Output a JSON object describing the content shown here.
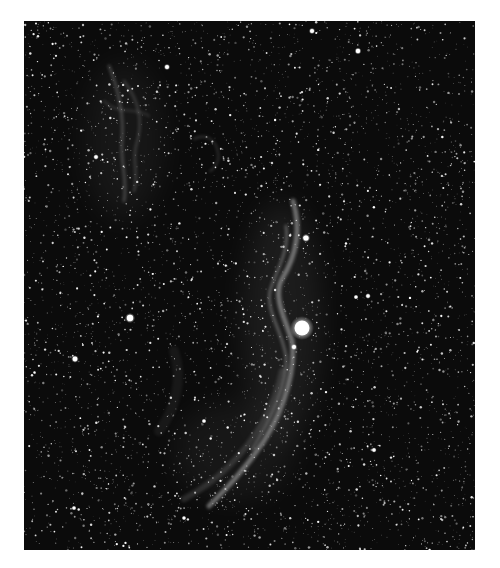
{
  "image": {
    "subject": "Veil Nebula (western arc) star field, grayscale astrophotograph",
    "background_color": "#ffffff",
    "frame": {
      "left": 24,
      "top": 21,
      "width": 451,
      "height": 529
    },
    "sky_color": "#0b0b0b",
    "star_field": {
      "count": 5200,
      "seed": 7331,
      "max_radius": 0.9
    },
    "bright_stars": [
      {
        "name": "bright-star-main",
        "x": 278,
        "y": 307,
        "r": 7.5
      },
      {
        "name": "bright-star-upper",
        "x": 282,
        "y": 217,
        "r": 2.6
      },
      {
        "name": "bright-star-left",
        "x": 106,
        "y": 297,
        "r": 3.2
      },
      {
        "name": "bright-star-far-left",
        "x": 51,
        "y": 338,
        "r": 2.4
      },
      {
        "name": "bright-star-top",
        "x": 288,
        "y": 10,
        "r": 2.0
      },
      {
        "name": "bright-star-top-right",
        "x": 334,
        "y": 30,
        "r": 2.2
      },
      {
        "name": "bright-star-top-left",
        "x": 143,
        "y": 46,
        "r": 2.0
      },
      {
        "name": "bright-star-near-nebula",
        "x": 270,
        "y": 326,
        "r": 2.0
      },
      {
        "name": "bright-star-right-1",
        "x": 344,
        "y": 275,
        "r": 1.8
      },
      {
        "name": "bright-star-right-2",
        "x": 332,
        "y": 276,
        "r": 1.6
      },
      {
        "name": "bright-star-mid",
        "x": 180,
        "y": 400,
        "r": 1.6
      },
      {
        "name": "bright-star-right-low",
        "x": 350,
        "y": 429,
        "r": 1.7
      },
      {
        "name": "bright-star-left-top",
        "x": 72,
        "y": 136,
        "r": 1.8
      },
      {
        "name": "bright-star-low-left",
        "x": 50,
        "y": 487,
        "r": 1.6
      },
      {
        "name": "bright-star-bottom",
        "x": 160,
        "y": 497,
        "r": 1.5
      }
    ],
    "nebula_filaments": [
      {
        "name": "witch-broom-main-arc",
        "path": "M 269 180 C 278 210, 272 235, 258 258 C 248 275, 262 300, 268 320 C 272 345, 262 385, 240 420 C 220 450, 200 470, 185 485",
        "width": 5,
        "opacity": 0.42
      },
      {
        "name": "witch-broom-inner-arc",
        "path": "M 262 205 C 266 230, 252 250, 246 270 C 242 290, 258 310, 262 335 C 264 360, 250 395, 228 428",
        "width": 3,
        "opacity": 0.3
      },
      {
        "name": "lower-arc-faint",
        "path": "M 258 350 C 250 390, 230 420, 205 445 C 190 460, 175 470, 160 478",
        "width": 6,
        "opacity": 0.14
      },
      {
        "name": "upper-left-filament-1",
        "path": "M 85 45 C 95 70, 100 95, 98 120 C 96 140, 104 160, 100 180",
        "width": 3,
        "opacity": 0.22
      },
      {
        "name": "upper-left-filament-2",
        "path": "M 100 60 C 115 80, 120 100, 112 125 C 108 140, 115 155, 110 170",
        "width": 2.5,
        "opacity": 0.18
      },
      {
        "name": "upper-left-wisp",
        "path": "M 80 80 C 95 95, 110 85, 125 95",
        "width": 2,
        "opacity": 0.14
      },
      {
        "name": "pickering-triangle-wisp",
        "path": "M 170 118 C 182 112, 192 118, 194 132 C 196 140, 190 148, 186 150",
        "width": 2,
        "opacity": 0.16
      },
      {
        "name": "mid-faint-glow",
        "path": "M 150 330 C 160 360, 150 390, 135 410",
        "width": 10,
        "opacity": 0.06
      }
    ],
    "glow_regions": [
      {
        "name": "nebula-glow-center",
        "cx": 258,
        "cy": 300,
        "rx": 40,
        "ry": 120,
        "opacity": 0.07
      },
      {
        "name": "nebula-glow-upper-left",
        "cx": 100,
        "cy": 120,
        "rx": 40,
        "ry": 80,
        "opacity": 0.05
      },
      {
        "name": "nebula-glow-lower",
        "cx": 210,
        "cy": 430,
        "rx": 60,
        "ry": 50,
        "opacity": 0.05
      }
    ]
  }
}
